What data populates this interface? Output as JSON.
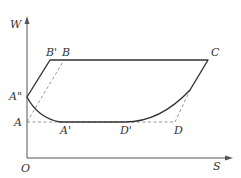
{
  "diagram": {
    "axes": {
      "y_label": "W",
      "x_label": "S",
      "origin_label": "O"
    },
    "points": {
      "A": "A",
      "A_prime": "A'",
      "A_double_prime": "A\"",
      "B": "B",
      "B_prime": "B'",
      "C": "C",
      "D": "D",
      "D_prime": "D'"
    },
    "colors": {
      "solid_line": "#333333",
      "dashed_line": "#888888",
      "axis": "#555555"
    }
  }
}
